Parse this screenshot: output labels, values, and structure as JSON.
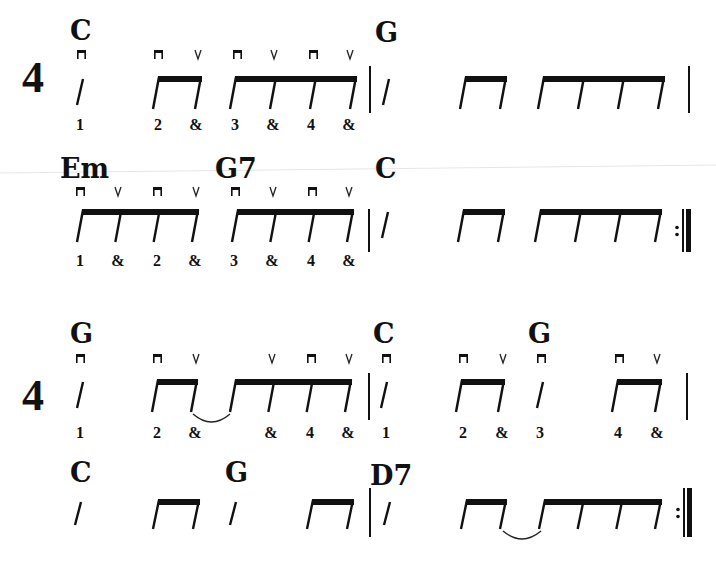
{
  "time_signature": "4",
  "colors": {
    "ink": "#111111",
    "paper": "#ffffff",
    "fold_line": "#e6e6e6"
  },
  "strum_symbols": {
    "down": "down-strum (⊓)",
    "up": "up-strum (V)"
  },
  "systems": [
    {
      "id": "line-1",
      "time_signature": "4",
      "chords": [
        {
          "label": "C",
          "x": 70,
          "y": 40
        },
        {
          "label": "G",
          "x": 375,
          "y": 42
        }
      ],
      "slashes": [
        {
          "x": 80
        },
        {
          "x": 386
        }
      ],
      "beams": [
        {
          "x1": 158,
          "x2": 200,
          "stems": 2
        },
        {
          "x1": 235,
          "x2": 355,
          "stems": 4
        },
        {
          "x1": 465,
          "x2": 505,
          "stems": 2
        },
        {
          "x1": 543,
          "x2": 663,
          "stems": 4
        }
      ],
      "strums": [
        {
          "type": "down",
          "x": 81
        },
        {
          "type": "down",
          "x": 158
        },
        {
          "type": "up",
          "x": 198
        },
        {
          "type": "down",
          "x": 237
        },
        {
          "type": "up",
          "x": 274
        },
        {
          "type": "down",
          "x": 313
        },
        {
          "type": "up",
          "x": 350
        }
      ],
      "counts": [
        {
          "text": "1",
          "x": 80
        },
        {
          "text": "2",
          "x": 158
        },
        {
          "text": "&",
          "x": 196
        },
        {
          "text": "3",
          "x": 235
        },
        {
          "text": "&",
          "x": 273
        },
        {
          "text": "4",
          "x": 311
        },
        {
          "text": "&",
          "x": 349
        }
      ],
      "barlines": [
        {
          "x": 370,
          "type": "single"
        },
        {
          "x": 689,
          "type": "single"
        }
      ],
      "ties": []
    },
    {
      "id": "line-2",
      "chords": [
        {
          "label": "Em",
          "x": 60,
          "y": 178
        },
        {
          "label": "G7",
          "x": 215,
          "y": 178
        },
        {
          "label": "C",
          "x": 375,
          "y": 178
        }
      ],
      "slashes": [
        {
          "x": 385
        }
      ],
      "beams": [
        {
          "x1": 82,
          "x2": 197,
          "stems": 4
        },
        {
          "x1": 237,
          "x2": 352,
          "stems": 4
        },
        {
          "x1": 463,
          "x2": 503,
          "stems": 2
        },
        {
          "x1": 540,
          "x2": 660,
          "stems": 4
        }
      ],
      "strums": [
        {
          "type": "down",
          "x": 80
        },
        {
          "type": "up",
          "x": 118
        },
        {
          "type": "down",
          "x": 157
        },
        {
          "type": "up",
          "x": 196
        },
        {
          "type": "down",
          "x": 235
        },
        {
          "type": "up",
          "x": 273
        },
        {
          "type": "down",
          "x": 312
        },
        {
          "type": "up",
          "x": 349
        }
      ],
      "counts": [
        {
          "text": "1",
          "x": 80
        },
        {
          "text": "&",
          "x": 118
        },
        {
          "text": "2",
          "x": 157
        },
        {
          "text": "&",
          "x": 195
        },
        {
          "text": "3",
          "x": 234
        },
        {
          "text": "&",
          "x": 272
        },
        {
          "text": "4",
          "x": 311
        },
        {
          "text": "&",
          "x": 349
        }
      ],
      "barlines": [
        {
          "x": 369,
          "type": "single"
        },
        {
          "x": 684,
          "type": "repeat-end"
        }
      ],
      "ties": []
    },
    {
      "id": "line-3",
      "time_signature": "4",
      "chords": [
        {
          "label": "G",
          "x": 70,
          "y": 343
        },
        {
          "label": "C",
          "x": 373,
          "y": 343
        },
        {
          "label": "G",
          "x": 528,
          "y": 343
        }
      ],
      "slashes": [
        {
          "x": 80
        },
        {
          "x": 384
        },
        {
          "x": 540
        }
      ],
      "beams": [
        {
          "x1": 157,
          "x2": 196,
          "stems": 2
        },
        {
          "x1": 235,
          "x2": 350,
          "stems": 4
        },
        {
          "x1": 461,
          "x2": 503,
          "stems": 2
        },
        {
          "x1": 617,
          "x2": 660,
          "stems": 2
        }
      ],
      "strums": [
        {
          "type": "down",
          "x": 80
        },
        {
          "type": "down",
          "x": 157
        },
        {
          "type": "up",
          "x": 196
        },
        {
          "type": "up",
          "x": 272
        },
        {
          "type": "down",
          "x": 311
        },
        {
          "type": "up",
          "x": 349
        },
        {
          "type": "down",
          "x": 386
        },
        {
          "type": "down",
          "x": 463
        },
        {
          "type": "up",
          "x": 503
        },
        {
          "type": "down",
          "x": 541
        },
        {
          "type": "down",
          "x": 619
        },
        {
          "type": "up",
          "x": 657
        }
      ],
      "counts": [
        {
          "text": "1",
          "x": 80
        },
        {
          "text": "2",
          "x": 157
        },
        {
          "text": "&",
          "x": 195
        },
        {
          "text": "&",
          "x": 271
        },
        {
          "text": "4",
          "x": 310
        },
        {
          "text": "&",
          "x": 348
        },
        {
          "text": "1",
          "x": 386
        },
        {
          "text": "2",
          "x": 463
        },
        {
          "text": "&",
          "x": 502
        },
        {
          "text": "3",
          "x": 540
        },
        {
          "text": "4",
          "x": 618
        },
        {
          "text": "&",
          "x": 657
        }
      ],
      "barlines": [
        {
          "x": 369,
          "type": "single"
        },
        {
          "x": 687,
          "type": "single"
        }
      ],
      "ties": [
        {
          "x1": 193,
          "x2": 230
        }
      ]
    },
    {
      "id": "line-4",
      "chords": [
        {
          "label": "C",
          "x": 70,
          "y": 482
        },
        {
          "label": "G",
          "x": 225,
          "y": 482
        },
        {
          "label": "D7",
          "x": 370,
          "y": 485
        }
      ],
      "slashes": [
        {
          "x": 78
        },
        {
          "x": 233
        },
        {
          "x": 387
        }
      ],
      "beams": [
        {
          "x1": 158,
          "x2": 198,
          "stems": 2
        },
        {
          "x1": 312,
          "x2": 352,
          "stems": 2
        },
        {
          "x1": 466,
          "x2": 505,
          "stems": 2
        },
        {
          "x1": 544,
          "x2": 660,
          "stems": 4
        }
      ],
      "strums": [],
      "counts": [],
      "barlines": [
        {
          "x": 370,
          "type": "single"
        },
        {
          "x": 685,
          "type": "repeat-end"
        }
      ],
      "ties": [
        {
          "x1": 503,
          "x2": 541
        }
      ]
    }
  ]
}
